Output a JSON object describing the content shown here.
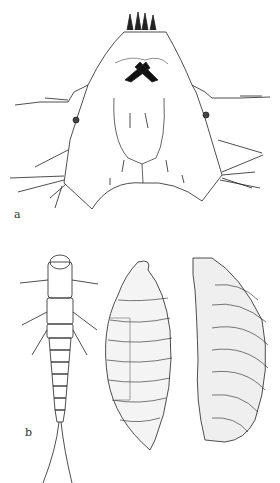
{
  "figure": {
    "panels": [
      {
        "label": "a",
        "subject": "larval-head-dorsal-view"
      },
      {
        "label": "b",
        "subject": "larva-dorsal-and-pupa-lateral-views"
      }
    ]
  }
}
